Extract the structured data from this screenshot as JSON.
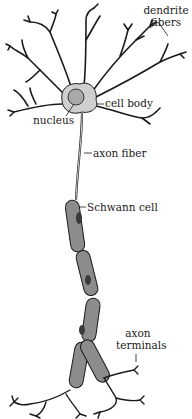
{
  "diagram": {
    "labels": {
      "dendrite_fibers_line1": "dendrite",
      "dendrite_fibers_line2": "fibers",
      "cell_body": "cell body",
      "nucleus": "nucleus",
      "axon_fiber": "axon fiber",
      "schwann_cell": "Schwann cell",
      "axon_terminals_line1": "axon",
      "axon_terminals_line2": "terminals"
    },
    "colors": {
      "ink": "#1a1a1a",
      "schwann_fill": "#8c8c8c",
      "cell_body_fill": "#cfcfcf",
      "nucleus_fill": "#a9a9a9",
      "background": "#ffffff"
    }
  }
}
